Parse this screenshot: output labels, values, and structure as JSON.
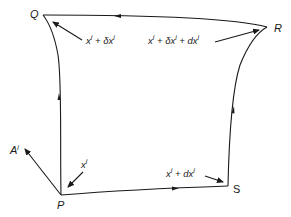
{
  "diagram": {
    "title": "",
    "points": {
      "P": "P",
      "Q": "Q",
      "R": "R",
      "S": "S"
    },
    "vector_label_base": "A",
    "vector_label_sup": "i",
    "coordinate_labels": {
      "P": {
        "base": "x",
        "sup": "i",
        "text": "x^i"
      },
      "Q": {
        "parts": [
          "x",
          "i",
          " + δx",
          "i"
        ],
        "text": "x^i + δx^i"
      },
      "R": {
        "parts": [
          "x",
          "i",
          " + δx",
          "i",
          " + dx",
          "i"
        ],
        "text": "x^i + δx^i + dx^i"
      },
      "S": {
        "parts": [
          "x",
          "i",
          " + dx",
          "i"
        ],
        "text": "x^i + dx^i"
      }
    },
    "edges": [
      {
        "from": "P",
        "to": "Q",
        "direction": "P→Q",
        "arrow": "midpoint"
      },
      {
        "from": "Q",
        "to": "R",
        "direction": "R→Q",
        "arrow": "midpoint"
      },
      {
        "from": "P",
        "to": "S",
        "direction": "P→S",
        "arrow": "midpoint"
      },
      {
        "from": "S",
        "to": "R",
        "direction": "S→R",
        "arrow": "midpoint"
      },
      {
        "from": "P",
        "to": "A",
        "direction": "P→A",
        "arrow": "end"
      }
    ],
    "colors": {
      "ink": "#1a1a1a",
      "background": "#ffffff"
    }
  }
}
